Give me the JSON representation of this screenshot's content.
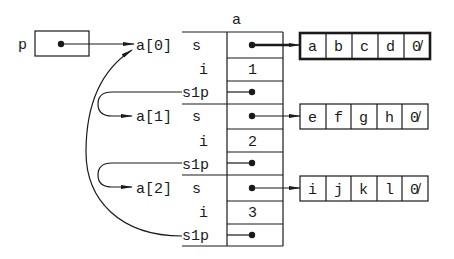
{
  "diagram": {
    "pointer": {
      "name": "p",
      "target": "a[0]"
    },
    "array": {
      "name": "a",
      "elements": [
        {
          "label": "a[0]",
          "fields": [
            {
              "name": "s",
              "value": "•",
              "points_to": "string0"
            },
            {
              "name": "i",
              "value": "1"
            },
            {
              "name": "s1p",
              "value": "•",
              "points_to": "a[0]"
            }
          ]
        },
        {
          "label": "a[1]",
          "fields": [
            {
              "name": "s",
              "value": "•",
              "points_to": "string1"
            },
            {
              "name": "i",
              "value": "2"
            },
            {
              "name": "s1p",
              "value": "•",
              "points_to": "a[2]"
            }
          ]
        },
        {
          "label": "a[2]",
          "fields": [
            {
              "name": "s",
              "value": "•",
              "points_to": "string2"
            },
            {
              "name": "i",
              "value": "3"
            },
            {
              "name": "s1p",
              "value": "•",
              "points_to": "a[1]"
            }
          ]
        }
      ]
    },
    "strings": [
      {
        "id": "string0",
        "chars": [
          "a",
          "b",
          "c",
          "d",
          "\\0"
        ],
        "highlighted": true
      },
      {
        "id": "string1",
        "chars": [
          "e",
          "f",
          "g",
          "h",
          "\\0"
        ],
        "highlighted": false
      },
      {
        "id": "string2",
        "chars": [
          "i",
          "j",
          "k",
          "l",
          "\\0"
        ],
        "highlighted": false
      }
    ],
    "null_glyph": "0̸"
  }
}
